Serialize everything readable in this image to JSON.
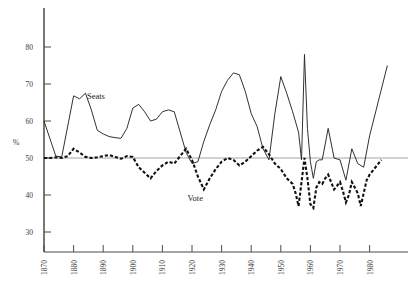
{
  "chart_data": {
    "type": "line",
    "title": "",
    "subtitle": "",
    "xlabel": "",
    "ylabel": "%",
    "xlim": [
      1868,
      1990
    ],
    "ylim": [
      28,
      84
    ],
    "grid": false,
    "gridlines": [
      50
    ],
    "legend_position": "inline-annotation",
    "x_ticks": [
      1870,
      1880,
      1890,
      1900,
      1910,
      1920,
      1930,
      1940,
      1950,
      1960,
      1970,
      1980
    ],
    "x_tick_labels": [
      "1870",
      "1880",
      "1890",
      "1900",
      "1910",
      "1920",
      "1930",
      "1940",
      "1950",
      "1960",
      "1970",
      "1980"
    ],
    "y_ticks": [
      30,
      40,
      50,
      60,
      70,
      80
    ],
    "y_tick_labels": [
      "30",
      "40",
      "50",
      "60",
      "70",
      "80"
    ],
    "annotations": [
      {
        "text": "Seats",
        "x": 1884.5,
        "y": 66.0
      },
      {
        "text": "Vote",
        "x": 1918.5,
        "y": 38.5
      }
    ],
    "series": [
      {
        "name": "Seats",
        "style": "solid",
        "color": "#262626",
        "points": [
          [
            1870,
            60.0
          ],
          [
            1874,
            50.5
          ],
          [
            1876,
            50.3
          ],
          [
            1880,
            66.8
          ],
          [
            1882,
            66.0
          ],
          [
            1884,
            67.5
          ],
          [
            1886,
            63.0
          ],
          [
            1888,
            57.5
          ],
          [
            1890,
            56.5
          ],
          [
            1892,
            55.8
          ],
          [
            1894,
            55.5
          ],
          [
            1896,
            55.3
          ],
          [
            1898,
            58.0
          ],
          [
            1900,
            63.5
          ],
          [
            1902,
            64.5
          ],
          [
            1904,
            62.5
          ],
          [
            1906,
            60.0
          ],
          [
            1908,
            60.5
          ],
          [
            1910,
            62.5
          ],
          [
            1912,
            63.0
          ],
          [
            1914,
            62.5
          ],
          [
            1918,
            51.5
          ],
          [
            1920,
            48.5
          ],
          [
            1922,
            49.0
          ],
          [
            1924,
            54.5
          ],
          [
            1926,
            59.0
          ],
          [
            1928,
            63.0
          ],
          [
            1930,
            68.0
          ],
          [
            1932,
            71.0
          ],
          [
            1934,
            73.0
          ],
          [
            1936,
            72.5
          ],
          [
            1938,
            68.0
          ],
          [
            1940,
            62.0
          ],
          [
            1942,
            58.5
          ],
          [
            1944,
            52.5
          ],
          [
            1946,
            49.5
          ],
          [
            1948,
            62.0
          ],
          [
            1950,
            72.0
          ],
          [
            1952,
            67.5
          ],
          [
            1954,
            62.5
          ],
          [
            1956,
            57.0
          ],
          [
            1957,
            49.5
          ],
          [
            1958,
            78.0
          ],
          [
            1959,
            58.0
          ],
          [
            1960,
            49.0
          ],
          [
            1961,
            44.5
          ],
          [
            1962,
            49.0
          ],
          [
            1963,
            49.5
          ],
          [
            1964,
            49.5
          ],
          [
            1966,
            58.0
          ],
          [
            1968,
            50.0
          ],
          [
            1970,
            49.5
          ],
          [
            1972,
            44.0
          ],
          [
            1974,
            52.5
          ],
          [
            1976,
            48.5
          ],
          [
            1978,
            47.5
          ],
          [
            1980,
            56.0
          ],
          [
            1986,
            75.0
          ]
        ]
      },
      {
        "name": "Vote",
        "style": "dashed",
        "color": "#111111",
        "points": [
          [
            1870,
            50.0
          ],
          [
            1872,
            50.0
          ],
          [
            1874,
            50.2
          ],
          [
            1876,
            50.0
          ],
          [
            1878,
            50.5
          ],
          [
            1880,
            52.5
          ],
          [
            1882,
            51.5
          ],
          [
            1884,
            50.3
          ],
          [
            1886,
            50.0
          ],
          [
            1888,
            50.2
          ],
          [
            1890,
            50.5
          ],
          [
            1892,
            50.8
          ],
          [
            1894,
            50.3
          ],
          [
            1896,
            49.8
          ],
          [
            1898,
            50.5
          ],
          [
            1900,
            50.3
          ],
          [
            1902,
            47.5
          ],
          [
            1904,
            46.0
          ],
          [
            1906,
            44.5
          ],
          [
            1908,
            46.5
          ],
          [
            1910,
            48.0
          ],
          [
            1912,
            49.0
          ],
          [
            1914,
            48.5
          ],
          [
            1916,
            50.5
          ],
          [
            1918,
            52.5
          ],
          [
            1920,
            49.5
          ],
          [
            1922,
            45.0
          ],
          [
            1924,
            41.5
          ],
          [
            1926,
            44.5
          ],
          [
            1928,
            47.0
          ],
          [
            1930,
            49.0
          ],
          [
            1932,
            50.0
          ],
          [
            1934,
            49.5
          ],
          [
            1936,
            48.0
          ],
          [
            1938,
            49.0
          ],
          [
            1940,
            50.5
          ],
          [
            1942,
            52.0
          ],
          [
            1944,
            53.0
          ],
          [
            1946,
            51.0
          ],
          [
            1948,
            48.5
          ],
          [
            1950,
            47.0
          ],
          [
            1952,
            44.5
          ],
          [
            1954,
            43.0
          ],
          [
            1955,
            40.5
          ],
          [
            1956,
            37.0
          ],
          [
            1957,
            43.5
          ],
          [
            1958,
            50.0
          ],
          [
            1959,
            44.5
          ],
          [
            1960,
            37.5
          ],
          [
            1961,
            36.5
          ],
          [
            1962,
            42.0
          ],
          [
            1963,
            43.5
          ],
          [
            1964,
            43.0
          ],
          [
            1965,
            44.5
          ],
          [
            1966,
            45.5
          ],
          [
            1968,
            41.5
          ],
          [
            1970,
            43.5
          ],
          [
            1971,
            41.0
          ],
          [
            1972,
            38.0
          ],
          [
            1973,
            40.0
          ],
          [
            1974,
            43.5
          ],
          [
            1976,
            40.5
          ],
          [
            1977,
            37.0
          ],
          [
            1978,
            40.5
          ],
          [
            1979,
            44.0
          ],
          [
            1980,
            45.5
          ],
          [
            1982,
            47.5
          ],
          [
            1984,
            49.5
          ]
        ]
      }
    ]
  },
  "styling": {
    "background": "#ffffff",
    "axis_color": "#4a4a4a",
    "gridline_color": "#9a9a9a",
    "seats_color": "#262626",
    "vote_color": "#111111"
  }
}
